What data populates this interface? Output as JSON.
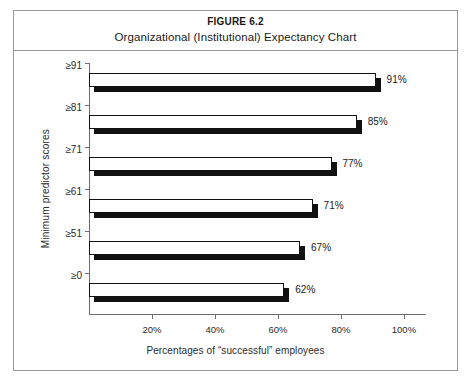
{
  "figure": {
    "number": "FIGURE 6.2",
    "title": "Organizational (Institutional) Expectancy Chart"
  },
  "chart_data": {
    "type": "bar",
    "orientation": "horizontal",
    "title": "Organizational (Institutional) Expectancy Chart",
    "xlabel": "Percentages of “successful” employees",
    "ylabel": "Minimum predictor scores",
    "categories": [
      "≥0",
      "≥51",
      "≥61",
      "≥71",
      "≥81",
      "≥91"
    ],
    "values": [
      62,
      67,
      71,
      77,
      85,
      91
    ],
    "value_labels": [
      "62%",
      "67%",
      "71%",
      "77%",
      "85%",
      "91%"
    ],
    "xlim": [
      0,
      107
    ],
    "xticks": [
      20,
      40,
      60,
      80,
      100
    ],
    "xtick_labels": [
      "20%",
      "40%",
      "60%",
      "80%",
      "100%"
    ],
    "grid": false,
    "legend": null,
    "bar_face_color": "#ffffff",
    "bar_edge_color": "#111111",
    "bar_shadow_color": "#111111"
  },
  "axes": {
    "y_title": "Minimum predictor scores",
    "x_title": "Percentages of “successful” employees"
  }
}
